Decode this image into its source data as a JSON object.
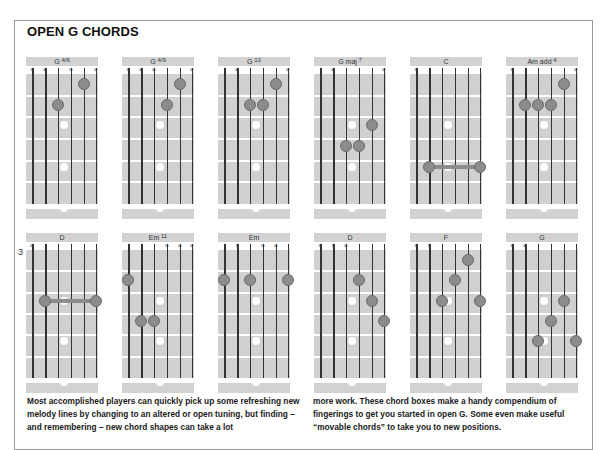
{
  "title": "OPEN G CHORDS",
  "colors": {
    "fretboard": "#d0d0d0",
    "finger": "#8c8c8c",
    "label_bar": "#d2d2d2",
    "border": "#9a9a9a"
  },
  "rows": [
    {
      "chords": [
        {
          "name": "G",
          "sup": "4/6",
          "markers": [
            "x",
            "o",
            "",
            "o",
            "",
            "o"
          ],
          "fingers": [
            {
              "s": 5,
              "f": 1
            },
            {
              "s": 3,
              "f": 2
            }
          ]
        },
        {
          "name": "G",
          "sup": "4/9",
          "markers": [
            "x",
            "o",
            "o",
            "",
            "",
            "o"
          ],
          "fingers": [
            {
              "s": 5,
              "f": 1
            },
            {
              "s": 4,
              "f": 2
            }
          ]
        },
        {
          "name": "G",
          "sup": "13",
          "markers": [
            "",
            "o",
            "",
            "",
            "",
            "o"
          ],
          "fingers": [
            {
              "s": 5,
              "f": 1
            },
            {
              "s": 3,
              "f": 2
            },
            {
              "s": 4,
              "f": 2
            }
          ]
        },
        {
          "name": "G maj",
          "sup": "7",
          "markers": [
            "",
            "o",
            "",
            "",
            "",
            "o"
          ],
          "fingers": [
            {
              "s": 5,
              "f": 3
            },
            {
              "s": 3,
              "f": 4
            },
            {
              "s": 4,
              "f": 4
            }
          ]
        },
        {
          "name": "C",
          "sup": "",
          "markers": [
            "x",
            "",
            "",
            "",
            "",
            ""
          ],
          "fingers": [],
          "barre": {
            "from": 2,
            "to": 6,
            "f": 5
          }
        },
        {
          "name": "Am add",
          "sup": "4",
          "markers": [
            "x",
            "",
            "",
            "",
            "",
            "o"
          ],
          "fingers": [
            {
              "s": 5,
              "f": 1
            },
            {
              "s": 2,
              "f": 2
            },
            {
              "s": 3,
              "f": 2
            },
            {
              "s": 4,
              "f": 2
            }
          ]
        }
      ]
    },
    {
      "chords": [
        {
          "name": "D",
          "sup": "",
          "fret_number": "3",
          "markers": [
            "o",
            "",
            "",
            "",
            "",
            ""
          ],
          "fingers": [],
          "barre": {
            "from": 2,
            "to": 6,
            "f": 3
          }
        },
        {
          "name": "Em",
          "sup": "11",
          "markers": [
            "",
            "",
            "",
            "o",
            "o",
            "o"
          ],
          "fingers": [
            {
              "s": 1,
              "f": 2
            },
            {
              "s": 2,
              "f": 4
            },
            {
              "s": 3,
              "f": 4
            }
          ]
        },
        {
          "name": "Em",
          "sup": "",
          "markers": [
            "",
            "x",
            "",
            "o",
            "o",
            ""
          ],
          "fingers": [
            {
              "s": 1,
              "f": 2
            },
            {
              "s": 3,
              "f": 2
            },
            {
              "s": 6,
              "f": 2
            }
          ]
        },
        {
          "name": "D",
          "sup": "",
          "markers": [
            "x",
            "x",
            "o",
            "",
            "",
            ""
          ],
          "fingers": [
            {
              "s": 4,
              "f": 2
            },
            {
              "s": 5,
              "f": 3
            },
            {
              "s": 6,
              "f": 4
            }
          ]
        },
        {
          "name": "F",
          "sup": "",
          "markers": [
            "x",
            "x",
            "",
            "",
            "",
            ""
          ],
          "fingers": [
            {
              "s": 5,
              "f": 1
            },
            {
              "s": 4,
              "f": 2
            },
            {
              "s": 3,
              "f": 3
            },
            {
              "s": 6,
              "f": 3
            }
          ]
        },
        {
          "name": "G",
          "sup": "",
          "markers": [
            "x",
            "o",
            "",
            "",
            "",
            ""
          ],
          "fingers": [
            {
              "s": 5,
              "f": 3
            },
            {
              "s": 4,
              "f": 4
            },
            {
              "s": 3,
              "f": 5
            },
            {
              "s": 6,
              "f": 5
            }
          ]
        }
      ]
    }
  ],
  "text": {
    "left": "Most accomplished players can quickly pick up some refreshing new melody lines by changing to an altered or open tuning, but finding – and remembering – new chord shapes can take a lot",
    "right": "more work. These chord boxes make a handy compendium of fingerings to get you started in open G. Some even make useful “movable chords” to take you to new positions."
  }
}
